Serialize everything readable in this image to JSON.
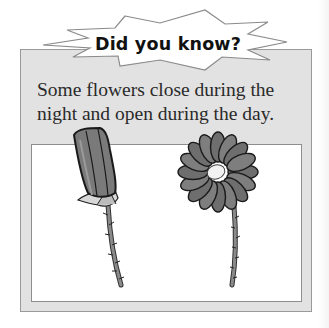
{
  "callout": {
    "title": "Did you know?",
    "fact": "Some flowers close during the night and open during the day."
  },
  "illustration": {
    "items": [
      {
        "name": "closed-flower",
        "state": "closed (night)"
      },
      {
        "name": "open-flower",
        "state": "open (day)"
      }
    ]
  },
  "colors": {
    "box_fill": "#e2e2e2",
    "box_border": "#9a9a9a",
    "panel_fill": "#ffffff",
    "petal_gray": "#7a7a7a",
    "outline": "#1a1a1a",
    "text": "#2a2a2a"
  }
}
